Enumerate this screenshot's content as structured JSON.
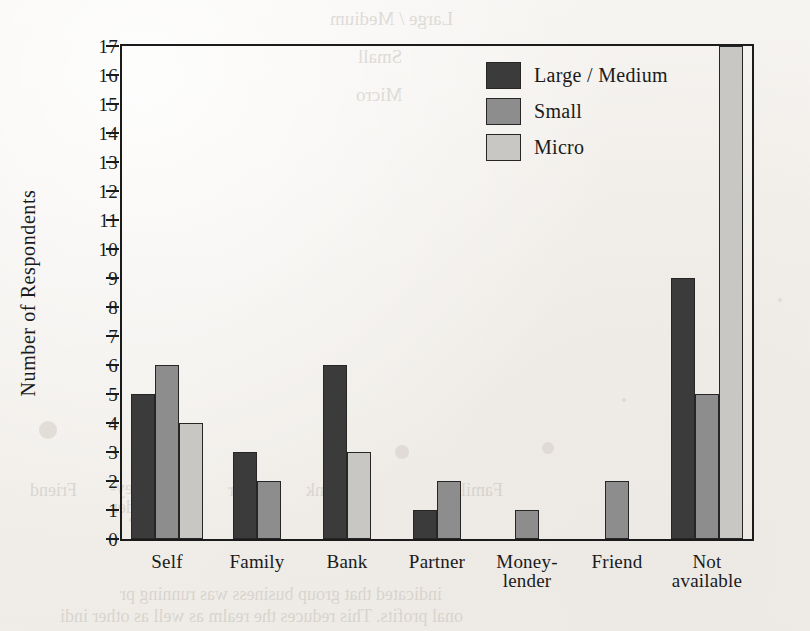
{
  "chart_data": {
    "type": "bar",
    "title": "",
    "xlabel": "",
    "ylabel": "Number of Respondents",
    "ylim": [
      0,
      17
    ],
    "ytick_step": 1,
    "yticks": [
      0,
      1,
      2,
      3,
      4,
      5,
      6,
      7,
      8,
      9,
      10,
      11,
      12,
      13,
      14,
      15,
      16,
      17
    ],
    "grid": false,
    "legend_position": "top-right-inside",
    "categories": [
      "Self",
      "Family",
      "Bank",
      "Partner",
      "Money-\nlender",
      "Friend",
      "Not\navailable"
    ],
    "series": [
      {
        "name": "Large / Medium",
        "color": "#3b3b3b",
        "values": [
          5,
          3,
          6,
          1,
          0,
          0,
          9
        ]
      },
      {
        "name": "Small",
        "color": "#8d8d8d",
        "values": [
          6,
          2,
          0,
          2,
          1,
          2,
          5
        ]
      },
      {
        "name": "Micro",
        "color": "#c9c7c3",
        "values": [
          4,
          0,
          3,
          0,
          0,
          0,
          17
        ]
      }
    ]
  },
  "legend": {
    "items": [
      {
        "label": "Large / Medium",
        "swatch": "s0"
      },
      {
        "label": "Small",
        "swatch": "s1"
      },
      {
        "label": "Micro",
        "swatch": "s2"
      }
    ]
  },
  "bleed_through": {
    "lines": [
      {
        "text": "Large / Medium",
        "x": 330,
        "y": 8,
        "size": 19
      },
      {
        "text": "Small",
        "x": 358,
        "y": 46,
        "size": 19
      },
      {
        "text": "Micro",
        "x": 356,
        "y": 84,
        "size": 19
      },
      {
        "text": "10",
        "x": 726,
        "y": 140,
        "size": 17
      },
      {
        "text": "9",
        "x": 730,
        "y": 165,
        "size": 17
      },
      {
        "text": "8",
        "x": 730,
        "y": 190,
        "size": 17
      },
      {
        "text": "7",
        "x": 730,
        "y": 215,
        "size": 17
      },
      {
        "text": "Family",
        "x": 452,
        "y": 480,
        "size": 18
      },
      {
        "text": "Bank",
        "x": 306,
        "y": 480,
        "size": 18
      },
      {
        "text": "Partner",
        "x": 228,
        "y": 480,
        "size": 18
      },
      {
        "text": "Money-",
        "x": 110,
        "y": 478,
        "size": 18
      },
      {
        "text": "lender",
        "x": 112,
        "y": 497,
        "size": 18
      },
      {
        "text": "Friend",
        "x": 30,
        "y": 480,
        "size": 18
      },
      {
        "text": "indicated that group business was running pr",
        "x": 120,
        "y": 584,
        "size": 18
      },
      {
        "text": "onal profits. This reduces the realm  as well as other indi",
        "x": 60,
        "y": 606,
        "size": 18
      }
    ],
    "specks": [
      {
        "x": 624,
        "y": 400,
        "r": 2
      },
      {
        "x": 131,
        "y": 520,
        "r": 2
      },
      {
        "x": 780,
        "y": 300,
        "r": 2
      },
      {
        "x": 48,
        "y": 430,
        "r": 9
      },
      {
        "x": 402,
        "y": 452,
        "r": 7
      },
      {
        "x": 548,
        "y": 448,
        "r": 6
      }
    ]
  }
}
